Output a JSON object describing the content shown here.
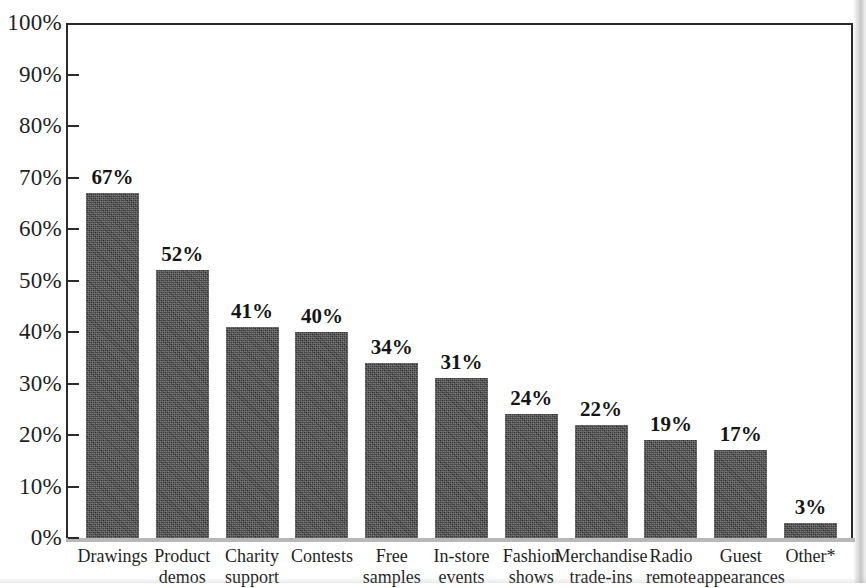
{
  "chart_data": {
    "type": "bar",
    "title": "",
    "xlabel": "",
    "ylabel": "",
    "ylim": [
      0,
      100
    ],
    "grid": false,
    "legend": "none",
    "value_label_suffix": "%",
    "categories": [
      "Drawings",
      "Product demos",
      "Charity support",
      "Contests",
      "Free samples",
      "In-store events",
      "Fashion shows",
      "Merchandise trade-ins",
      "Radio remote",
      "Guest appearances",
      "Other*"
    ],
    "category_lines": [
      [
        "Drawings"
      ],
      [
        "Product",
        "demos"
      ],
      [
        "Charity",
        "support"
      ],
      [
        "Contests"
      ],
      [
        "Free",
        "samples"
      ],
      [
        "In-store",
        "events"
      ],
      [
        "Fashion",
        "shows"
      ],
      [
        "Merchandise",
        "trade-ins"
      ],
      [
        "Radio",
        "remote"
      ],
      [
        "Guest",
        "appearances"
      ],
      [
        "Other*"
      ]
    ],
    "values": [
      67,
      52,
      41,
      40,
      34,
      31,
      24,
      22,
      19,
      17,
      3
    ],
    "value_labels": [
      "67%",
      "52%",
      "41%",
      "40%",
      "34%",
      "31%",
      "24%",
      "22%",
      "19%",
      "17%",
      "3%"
    ],
    "yticks": [
      0,
      10,
      20,
      30,
      40,
      50,
      60,
      70,
      80,
      90,
      100
    ],
    "ytick_labels": [
      "0%",
      "10%",
      "20%",
      "30%",
      "40%",
      "50%",
      "60%",
      "70%",
      "80%",
      "90%",
      "100%"
    ],
    "colors": {
      "bar_fill": "#3b3b3b",
      "axis": "#2b2b2b",
      "text": "#1f1f1f",
      "background": "#ffffff"
    }
  }
}
